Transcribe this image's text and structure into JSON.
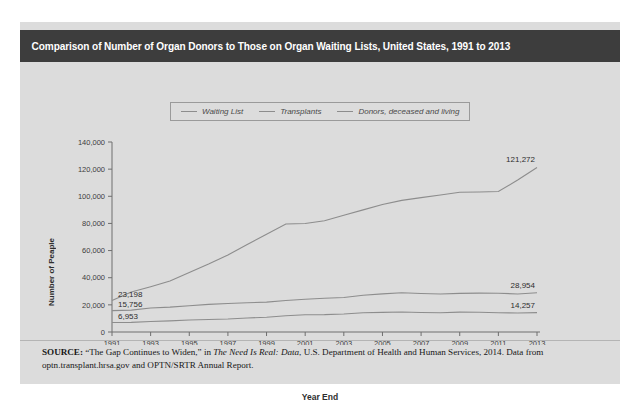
{
  "figure": {
    "title": "Comparison of Number of Organ Donors to Those on Organ Waiting Lists, United States, 1991 to 2013",
    "source": {
      "prefix": "SOURCE:",
      "part1": " “The Gap Continues to Widen,” in ",
      "italic1": "The Need Is Real: Data",
      "part2": ", U.S. Department of Health and Human Services, 2014. Data from optn.transplant.hrsa.gov and OPTN/SRTR Annual Report."
    }
  },
  "colors": {
    "title_bar": "#3d3d3d",
    "panel": "#dcdcdc",
    "line": "#8d8d8d",
    "axis": "#6e6e6e",
    "text": "#2e2e2e"
  },
  "chart_data": {
    "type": "line",
    "title": "Comparison of Number of Organ Donors to Those on Organ Waiting Lists, United States, 1991 to 2013",
    "xlabel": "Year End",
    "ylabel": "Number of Peaple",
    "grid": false,
    "legend_position": "top-center",
    "xlim": [
      1991,
      2013
    ],
    "ylim": [
      0,
      140000
    ],
    "yticks": [
      0,
      20000,
      40000,
      60000,
      80000,
      100000,
      120000,
      140000
    ],
    "ytick_labels": [
      "0",
      "20,000",
      "40,000",
      "60,000",
      "80,000",
      "100,000",
      "120,000",
      "140,000"
    ],
    "x": [
      1991,
      1992,
      1993,
      1994,
      1995,
      1996,
      1997,
      1998,
      1999,
      2000,
      2001,
      2002,
      2003,
      2004,
      2005,
      2006,
      2007,
      2008,
      2009,
      2010,
      2011,
      2012,
      2013
    ],
    "xtick_values": [
      1991,
      1993,
      1995,
      1997,
      1999,
      2001,
      2003,
      2005,
      2007,
      2009,
      2011,
      2013
    ],
    "xtick_labels": [
      "1991",
      "1993",
      "1995",
      "1997",
      "1999",
      "2001",
      "2003",
      "2005",
      "2007",
      "2009",
      "2011",
      "2013"
    ],
    "series": [
      {
        "name": "Waiting List",
        "values": [
          23198,
          29415,
          33394,
          37621,
          43930,
          50051,
          56716,
          64459,
          72022,
          79524,
          80000,
          82000,
          86000,
          90000,
          94000,
          97000,
          99000,
          101000,
          103000,
          103200,
          103500,
          112000,
          121272
        ],
        "start_label": "23,198",
        "end_label": "121,272"
      },
      {
        "name": "Transplants",
        "values": [
          15756,
          16134,
          17632,
          18298,
          19396,
          20360,
          20961,
          21522,
          22026,
          23257,
          24181,
          24900,
          25470,
          27033,
          28118,
          28935,
          28358,
          27966,
          28465,
          28663,
          28538,
          28052,
          28954
        ],
        "start_label": "15,756",
        "end_label": "28,954"
      },
      {
        "name": "Donors, deceased and living",
        "values": [
          6953,
          7091,
          7766,
          8208,
          8851,
          9199,
          9539,
          10362,
          10861,
          11932,
          12701,
          12819,
          13284,
          14154,
          14491,
          14756,
          14400,
          14208,
          14631,
          14504,
          14145,
          14013,
          14257
        ],
        "start_label": "6,953",
        "end_label": "14,257"
      }
    ]
  }
}
